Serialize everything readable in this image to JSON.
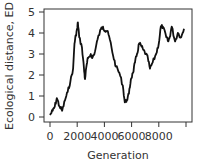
{
  "chart_data": {
    "type": "line",
    "title": "",
    "xlabel": "Generation",
    "ylabel": "Ecological distance, ED",
    "xlim": [
      0,
      10000
    ],
    "ylim": [
      0,
      5
    ],
    "xticks": [
      0,
      2000,
      4000,
      6000,
      8000,
      10000
    ],
    "xtick_labels": [
      "0",
      "2000",
      "4000",
      "6000",
      "8000",
      ""
    ],
    "yticks": [
      0,
      1,
      2,
      3,
      4,
      5
    ],
    "ytick_labels": [
      "0",
      "1",
      "2",
      "3",
      "4",
      "5"
    ],
    "grid": false,
    "legend": null,
    "series": [
      {
        "name": "ED",
        "color": "#111111",
        "x": [
          0,
          200,
          350,
          500,
          700,
          900,
          1100,
          1300,
          1500,
          1700,
          1800,
          1900,
          2000,
          2050,
          2150,
          2350,
          2500,
          2570,
          2700,
          2800,
          3000,
          3100,
          3300,
          3500,
          3750,
          3900,
          4050,
          4200,
          4400,
          4650,
          4850,
          5100,
          5350,
          5500,
          5650,
          5800,
          5950,
          6100,
          6250,
          6400,
          6550,
          6700,
          6850,
          7050,
          7200,
          7350,
          7550,
          7800,
          8000,
          8150,
          8300,
          8550,
          8700,
          8800,
          8950,
          9200,
          9400,
          9650,
          9850
        ],
        "values": [
          0.1,
          0.3,
          0.5,
          0.9,
          0.5,
          0.3,
          0.8,
          1.2,
          1.7,
          2.3,
          3.5,
          3.9,
          4.2,
          4.5,
          3.8,
          3.3,
          2.3,
          1.8,
          2.5,
          2.8,
          3.0,
          2.8,
          3.1,
          3.7,
          4.2,
          4.3,
          4.1,
          4.1,
          3.7,
          2.9,
          2.4,
          2.1,
          1.5,
          0.7,
          0.8,
          1.1,
          1.8,
          2.1,
          2.6,
          3.0,
          3.5,
          3.4,
          3.2,
          3.0,
          2.8,
          2.3,
          2.6,
          3.0,
          3.5,
          4.3,
          4.3,
          3.8,
          3.6,
          3.8,
          4.3,
          3.6,
          4.0,
          3.8,
          4.2
        ]
      }
    ]
  }
}
